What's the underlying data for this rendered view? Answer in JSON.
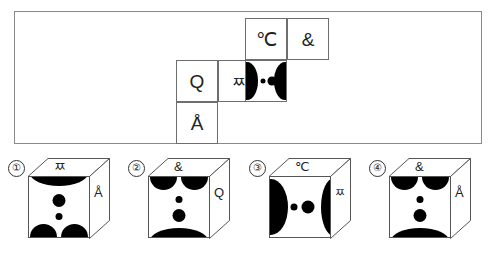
{
  "puzzle": {
    "type": "cube-net-folding",
    "net": {
      "cells": [
        {
          "id": "celsius",
          "label": "℃",
          "row": 0,
          "col": 2,
          "kind": "glyph"
        },
        {
          "id": "ampersand",
          "label": "&",
          "row": 0,
          "col": 3,
          "kind": "glyph"
        },
        {
          "id": "q",
          "label": "Q",
          "row": 1,
          "col": 0,
          "kind": "glyph"
        },
        {
          "id": "ssangjieut",
          "label": "ㅉ",
          "row": 1,
          "col": 1,
          "kind": "glyph"
        },
        {
          "id": "face",
          "label": "",
          "row": 1,
          "col": 2,
          "kind": "pattern",
          "pattern": "face-horizontal"
        },
        {
          "id": "angstrom",
          "label": "Å",
          "row": 2,
          "col": 0,
          "kind": "glyph"
        }
      ]
    },
    "options": [
      {
        "number": "①",
        "top_label": "ㅉ",
        "side_label": "Å",
        "front_pattern": "arc-top-twin-bottom"
      },
      {
        "number": "②",
        "top_label": "&",
        "side_label": "Q",
        "front_pattern": "twin-top-arc-bottom"
      },
      {
        "number": "③",
        "top_label": "℃",
        "side_label": "ㅉ",
        "front_pattern": "face-horizontal"
      },
      {
        "number": "④",
        "top_label": "&",
        "side_label": "Å",
        "front_pattern": "twin-top-arc-bottom"
      }
    ]
  },
  "colors": {
    "ink": "#000000",
    "frame_border": "#8a8a8a",
    "cell_border": "#6e6e6e",
    "cube_border": "#555555",
    "background": "#ffffff"
  }
}
